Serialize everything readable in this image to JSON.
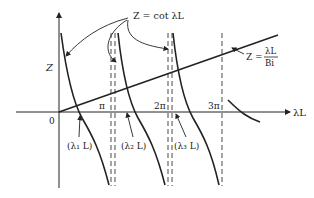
{
  "figure": {
    "axes": {
      "y_label": "Z",
      "x_label": "λL",
      "origin_label": "0",
      "x_ticks": [
        "π",
        "2π",
        "3π"
      ]
    },
    "curves": {
      "cot_label_lhs": "Z = cot λL",
      "line_label_lhs": "Z =",
      "line_label_num": "λL",
      "line_label_den": "Bi"
    },
    "roots": [
      {
        "label": "(λ₁ L)"
      },
      {
        "label": "(λ₂ L)"
      },
      {
        "label": "(λ₃ L)"
      }
    ],
    "colors": {
      "ink": "#222222",
      "background": "#ffffff"
    }
  }
}
